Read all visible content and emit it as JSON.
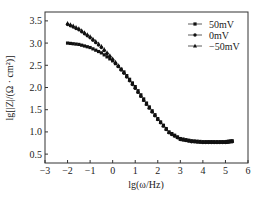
{
  "chart_data": {
    "type": "line",
    "title": "",
    "xlabel": "lg(ω/Hz)",
    "ylabel": "lg[|Z|/(Ω · cm²)]",
    "xlim": [
      -3,
      6
    ],
    "ylim": [
      0.3,
      3.7
    ],
    "xticks": [
      -3,
      -2,
      -1,
      0,
      1,
      2,
      3,
      4,
      5,
      6
    ],
    "yticks": [
      0.5,
      1.0,
      1.5,
      2.0,
      2.5,
      3.0,
      3.5
    ],
    "ytick_labels": [
      "0.5",
      "1.0",
      "1.5",
      "2.0",
      "2.5",
      "3.0",
      "3.5"
    ],
    "grid": false,
    "legend_position": "upper right",
    "x": [
      -2.0,
      -1.5,
      -1.0,
      -0.5,
      0.0,
      0.5,
      1.0,
      1.5,
      2.0,
      2.5,
      3.0,
      3.5,
      4.0,
      4.5,
      5.0,
      5.3
    ],
    "series": [
      {
        "name": "50mV",
        "marker": "square",
        "values": [
          3.0,
          2.97,
          2.9,
          2.78,
          2.6,
          2.35,
          2.02,
          1.65,
          1.3,
          1.0,
          0.85,
          0.8,
          0.78,
          0.78,
          0.78,
          0.8
        ]
      },
      {
        "name": "0mV",
        "marker": "circle",
        "values": [
          3.42,
          3.3,
          3.12,
          2.9,
          2.62,
          2.32,
          1.98,
          1.62,
          1.28,
          0.98,
          0.83,
          0.78,
          0.76,
          0.76,
          0.76,
          0.78
        ]
      },
      {
        "name": "−50mV",
        "marker": "triangle",
        "values": [
          3.45,
          3.33,
          3.15,
          2.93,
          2.65,
          2.34,
          2.0,
          1.63,
          1.29,
          0.99,
          0.84,
          0.79,
          0.77,
          0.77,
          0.77,
          0.79
        ]
      }
    ]
  }
}
